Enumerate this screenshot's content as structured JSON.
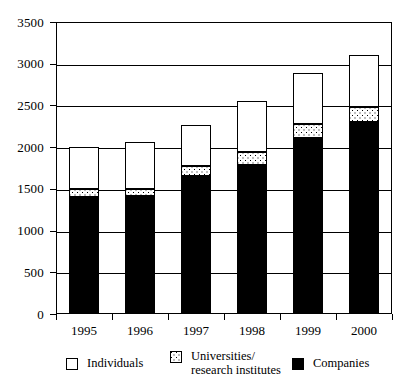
{
  "chart_data": {
    "type": "bar",
    "subtype": "stacked-vertical",
    "title": "",
    "xlabel": "",
    "ylabel": "",
    "categories": [
      "1995",
      "1996",
      "1997",
      "1998",
      "1999",
      "2000"
    ],
    "ylim": [
      0,
      3500
    ],
    "yticks": [
      0,
      500,
      1000,
      1500,
      2000,
      2500,
      3000,
      3500
    ],
    "ytick_labels": [
      "0",
      "500",
      "1000",
      "1500",
      "2000",
      "2500",
      "3000",
      "3500"
    ],
    "grid": true,
    "grid_axis": "y",
    "legend_position": "bottom",
    "stack_order_bottom_to_top": [
      "Companies",
      "Universities/research institutes",
      "Individuals"
    ],
    "series": [
      {
        "name": "Companies",
        "color": "#000000",
        "pattern": "solid-black",
        "values": [
          1400,
          1420,
          1650,
          1790,
          2110,
          2300
        ]
      },
      {
        "name": "Universities/research institutes",
        "color": "#ffffff",
        "pattern": "dotted",
        "values": [
          100,
          80,
          120,
          150,
          170,
          180
        ]
      },
      {
        "name": "Individuals",
        "color": "#ffffff",
        "pattern": "solid-white",
        "values": [
          500,
          560,
          500,
          610,
          610,
          620
        ]
      }
    ],
    "totals": [
      2000,
      2060,
      2270,
      2550,
      2890,
      3100
    ]
  },
  "legend": {
    "items": [
      {
        "label": "Individuals",
        "swatch": "individuals"
      },
      {
        "label": "Universities/\nresearch institutes",
        "swatch": "universities"
      },
      {
        "label": "Companies",
        "swatch": "companies"
      }
    ]
  },
  "colors": {
    "axis": "#000000",
    "grid": "#000000",
    "background": "#ffffff",
    "companies": "#000000",
    "universities": "#ffffff",
    "individuals": "#ffffff"
  }
}
